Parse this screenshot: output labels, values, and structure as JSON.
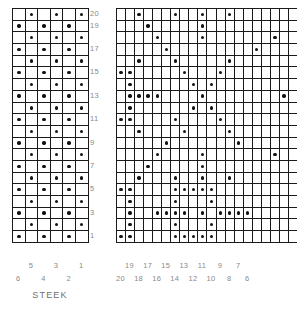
{
  "figure": {
    "title_text": "STEEK",
    "dot_color": "#111111",
    "grid_color": "#1a1a1a",
    "label_color": "#8a8a8a",
    "background": "#ffffff"
  },
  "left_chart": {
    "name": "steek-chart",
    "columns": 6,
    "rows": 20,
    "caption": "STEEK",
    "row_labels": [
      "20",
      "19",
      "",
      "17",
      "",
      "15",
      "",
      "13",
      "",
      "11",
      "",
      "9",
      "",
      "7",
      "",
      "5",
      "",
      "3",
      "",
      "1"
    ],
    "column_labels_top_row": [
      "5",
      "3",
      "1"
    ],
    "column_labels_bottom_row": [
      "6",
      "4",
      "2"
    ],
    "column_labels_all": [
      "6",
      "5",
      "4",
      "3",
      "2",
      "1"
    ],
    "description": "Two-colour checkerboard steek; columns numbered right to left, odd rows have dots in odd columns.",
    "cells": [
      [
        0,
        1,
        0,
        1,
        0,
        1
      ],
      [
        1,
        0,
        1,
        0,
        1,
        0
      ],
      [
        0,
        1,
        0,
        1,
        0,
        1
      ],
      [
        1,
        0,
        1,
        0,
        1,
        0
      ],
      [
        0,
        1,
        0,
        1,
        0,
        1
      ],
      [
        1,
        0,
        1,
        0,
        1,
        0
      ],
      [
        0,
        1,
        0,
        1,
        0,
        1
      ],
      [
        1,
        0,
        1,
        0,
        1,
        0
      ],
      [
        0,
        1,
        0,
        1,
        0,
        1
      ],
      [
        1,
        0,
        1,
        0,
        1,
        0
      ],
      [
        0,
        1,
        0,
        1,
        0,
        1
      ],
      [
        1,
        0,
        1,
        0,
        1,
        0
      ],
      [
        0,
        1,
        0,
        1,
        0,
        1
      ],
      [
        1,
        0,
        1,
        0,
        1,
        0
      ],
      [
        0,
        1,
        0,
        1,
        0,
        1
      ],
      [
        1,
        0,
        1,
        0,
        1,
        0
      ],
      [
        0,
        1,
        0,
        1,
        0,
        1
      ],
      [
        1,
        0,
        1,
        0,
        1,
        0
      ],
      [
        0,
        1,
        0,
        1,
        0,
        1
      ],
      [
        1,
        0,
        1,
        0,
        1,
        0
      ]
    ]
  },
  "right_chart": {
    "name": "motif-chart",
    "columns": 20,
    "rows": 20,
    "column_labels_top_row": [
      "19",
      "17",
      "15",
      "13",
      "11",
      "9",
      "7"
    ],
    "column_labels_bottom_row": [
      "20",
      "18",
      "16",
      "14",
      "12",
      "10",
      "8",
      "6"
    ],
    "column_labels_all": [
      "20",
      "19",
      "18",
      "17",
      "16",
      "15",
      "14",
      "13",
      "12",
      "11",
      "10",
      "9",
      "8",
      "7",
      "6",
      "5",
      "4",
      "3",
      "2",
      "1"
    ],
    "description": "Colourwork motif chart, 20 stitches by 20 rows, columns numbered right to left.",
    "cells": [
      [
        0,
        0,
        1,
        0,
        0,
        0,
        1,
        0,
        0,
        1,
        0,
        0,
        1,
        0,
        0,
        0,
        0,
        0,
        0,
        0
      ],
      [
        0,
        0,
        0,
        1,
        0,
        0,
        0,
        0,
        0,
        1,
        0,
        0,
        0,
        0,
        0,
        0,
        0,
        0,
        0,
        0
      ],
      [
        0,
        0,
        0,
        0,
        1,
        0,
        0,
        0,
        0,
        1,
        0,
        0,
        0,
        0,
        0,
        0,
        0,
        1,
        0,
        0
      ],
      [
        0,
        0,
        0,
        0,
        0,
        1,
        0,
        0,
        0,
        0,
        0,
        0,
        0,
        0,
        0,
        1,
        0,
        0,
        0,
        0
      ],
      [
        0,
        0,
        1,
        0,
        0,
        0,
        1,
        0,
        0,
        0,
        0,
        0,
        1,
        0,
        0,
        0,
        0,
        0,
        0,
        0
      ],
      [
        1,
        1,
        0,
        0,
        0,
        0,
        0,
        1,
        0,
        0,
        0,
        1,
        0,
        0,
        0,
        0,
        0,
        0,
        0,
        0
      ],
      [
        0,
        1,
        0,
        0,
        0,
        0,
        0,
        0,
        1,
        0,
        1,
        0,
        0,
        0,
        0,
        0,
        0,
        0,
        0,
        0
      ],
      [
        0,
        1,
        1,
        1,
        1,
        0,
        0,
        0,
        0,
        1,
        0,
        0,
        0,
        0,
        0,
        0,
        0,
        0,
        1,
        0
      ],
      [
        0,
        1,
        0,
        0,
        0,
        0,
        0,
        0,
        1,
        0,
        1,
        0,
        0,
        0,
        0,
        0,
        0,
        0,
        0,
        0
      ],
      [
        1,
        1,
        0,
        0,
        0,
        0,
        1,
        0,
        0,
        0,
        0,
        1,
        0,
        0,
        0,
        0,
        0,
        0,
        0,
        0
      ],
      [
        0,
        0,
        1,
        0,
        0,
        0,
        0,
        1,
        0,
        0,
        0,
        0,
        1,
        0,
        0,
        0,
        0,
        0,
        0,
        0
      ],
      [
        0,
        0,
        0,
        0,
        0,
        1,
        0,
        0,
        0,
        0,
        0,
        0,
        0,
        1,
        0,
        0,
        0,
        0,
        0,
        0
      ],
      [
        0,
        0,
        0,
        0,
        1,
        0,
        0,
        0,
        0,
        1,
        0,
        0,
        0,
        0,
        0,
        0,
        0,
        1,
        0,
        0
      ],
      [
        0,
        0,
        0,
        1,
        0,
        0,
        0,
        0,
        0,
        1,
        0,
        0,
        0,
        0,
        0,
        0,
        0,
        0,
        0,
        0
      ],
      [
        0,
        0,
        1,
        0,
        0,
        0,
        1,
        0,
        0,
        1,
        0,
        0,
        1,
        0,
        0,
        0,
        0,
        0,
        0,
        0
      ],
      [
        1,
        1,
        0,
        0,
        0,
        0,
        1,
        1,
        1,
        1,
        1,
        0,
        0,
        0,
        0,
        0,
        0,
        0,
        0,
        0
      ],
      [
        0,
        1,
        0,
        0,
        0,
        0,
        1,
        0,
        0,
        0,
        1,
        0,
        0,
        0,
        0,
        0,
        0,
        0,
        0,
        0
      ],
      [
        0,
        1,
        0,
        0,
        1,
        1,
        1,
        1,
        0,
        1,
        0,
        1,
        1,
        1,
        1,
        0,
        0,
        0,
        0,
        0
      ],
      [
        0,
        1,
        0,
        0,
        0,
        0,
        1,
        0,
        0,
        0,
        1,
        0,
        0,
        0,
        0,
        0,
        0,
        0,
        0,
        0
      ],
      [
        1,
        1,
        0,
        0,
        0,
        0,
        1,
        1,
        1,
        1,
        1,
        0,
        0,
        0,
        0,
        0,
        0,
        0,
        0,
        0
      ]
    ]
  }
}
